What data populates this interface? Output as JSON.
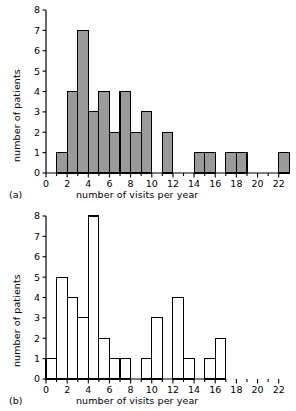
{
  "figure": {
    "name": "two-histograms-number-of-visits-per-year",
    "panels": [
      {
        "tag": "(a)",
        "xlabel": "number of visits per year",
        "ylabel": "number of patients"
      },
      {
        "tag": "(b)",
        "xlabel": "number of visits per year",
        "ylabel": "number of patients"
      }
    ]
  },
  "colors": {
    "bar_fill_a": "#9a9a9a",
    "bar_fill_b": "#ffffff",
    "bar_stroke": "#000000",
    "axis": "#000000",
    "background": "#ffffff"
  },
  "chart_data": [
    {
      "type": "bar",
      "name": "panel-a",
      "title": "(a)",
      "xlabel": "number of visits per year",
      "ylabel": "number of patients",
      "xlim": [
        0,
        22.5
      ],
      "ylim": [
        0,
        8
      ],
      "xticks": [
        0,
        2,
        4,
        6,
        8,
        10,
        12,
        14,
        16,
        18,
        20,
        22
      ],
      "xtick_labels": [
        "0",
        "2",
        "4",
        "6",
        "8",
        "10",
        "12",
        "14",
        "16",
        "18",
        "20",
        "22"
      ],
      "yticks": [
        0,
        1,
        2,
        3,
        4,
        5,
        6,
        7,
        8
      ],
      "ytick_labels": [
        "0",
        "1",
        "2",
        "3",
        "4",
        "5",
        "6",
        "7",
        "8"
      ],
      "grid": false,
      "legend": null,
      "bin_width": 1,
      "bins": [
        {
          "x0": 0,
          "x1": 1,
          "value": 0
        },
        {
          "x0": 1,
          "x1": 2,
          "value": 1
        },
        {
          "x0": 2,
          "x1": 3,
          "value": 4
        },
        {
          "x0": 3,
          "x1": 4,
          "value": 7
        },
        {
          "x0": 4,
          "x1": 5,
          "value": 3
        },
        {
          "x0": 5,
          "x1": 6,
          "value": 4
        },
        {
          "x0": 6,
          "x1": 7,
          "value": 2
        },
        {
          "x0": 7,
          "x1": 8,
          "value": 4
        },
        {
          "x0": 8,
          "x1": 9,
          "value": 2
        },
        {
          "x0": 9,
          "x1": 10,
          "value": 3
        },
        {
          "x0": 10,
          "x1": 11,
          "value": 0
        },
        {
          "x0": 11,
          "x1": 12,
          "value": 2
        },
        {
          "x0": 12,
          "x1": 13,
          "value": 0
        },
        {
          "x0": 13,
          "x1": 14,
          "value": 0
        },
        {
          "x0": 14,
          "x1": 15,
          "value": 1
        },
        {
          "x0": 15,
          "x1": 16,
          "value": 1
        },
        {
          "x0": 16,
          "x1": 17,
          "value": 0
        },
        {
          "x0": 17,
          "x1": 18,
          "value": 1
        },
        {
          "x0": 18,
          "x1": 19,
          "value": 1
        },
        {
          "x0": 19,
          "x1": 20,
          "value": 0
        },
        {
          "x0": 20,
          "x1": 21,
          "value": 0
        },
        {
          "x0": 21,
          "x1": 22,
          "value": 0
        },
        {
          "x0": 22,
          "x1": 23,
          "value": 1
        }
      ],
      "axis_end": 22.5
    },
    {
      "type": "bar",
      "name": "panel-b",
      "title": "(b)",
      "xlabel": "number of visits per year",
      "ylabel": "number of patients",
      "xlim": [
        0,
        22.5
      ],
      "ylim": [
        0,
        8
      ],
      "xticks": [
        0,
        2,
        4,
        6,
        8,
        10,
        12,
        14,
        16,
        18,
        20,
        22
      ],
      "xtick_labels": [
        "0",
        "2",
        "4",
        "6",
        "8",
        "10",
        "12",
        "14",
        "16",
        "18",
        "20",
        "22"
      ],
      "yticks": [
        0,
        1,
        2,
        3,
        4,
        5,
        6,
        7,
        8
      ],
      "ytick_labels": [
        "0",
        "1",
        "2",
        "3",
        "4",
        "5",
        "6",
        "7",
        "8"
      ],
      "grid": false,
      "legend": null,
      "bin_width": 1,
      "bins": [
        {
          "x0": 0,
          "x1": 1,
          "value": 1
        },
        {
          "x0": 1,
          "x1": 2,
          "value": 5
        },
        {
          "x0": 2,
          "x1": 3,
          "value": 4
        },
        {
          "x0": 3,
          "x1": 4,
          "value": 3
        },
        {
          "x0": 4,
          "x1": 5,
          "value": 8
        },
        {
          "x0": 5,
          "x1": 6,
          "value": 2
        },
        {
          "x0": 6,
          "x1": 7,
          "value": 1
        },
        {
          "x0": 7,
          "x1": 8,
          "value": 1
        },
        {
          "x0": 8,
          "x1": 9,
          "value": 0
        },
        {
          "x0": 9,
          "x1": 10,
          "value": 1
        },
        {
          "x0": 10,
          "x1": 11,
          "value": 3
        },
        {
          "x0": 11,
          "x1": 12,
          "value": 0
        },
        {
          "x0": 12,
          "x1": 13,
          "value": 4
        },
        {
          "x0": 13,
          "x1": 14,
          "value": 1
        },
        {
          "x0": 14,
          "x1": 15,
          "value": 0
        },
        {
          "x0": 15,
          "x1": 16,
          "value": 1
        },
        {
          "x0": 16,
          "x1": 17,
          "value": 2
        },
        {
          "x0": 17,
          "x1": 18,
          "value": 0
        },
        {
          "x0": 18,
          "x1": 19,
          "value": 0
        },
        {
          "x0": 19,
          "x1": 20,
          "value": 0
        },
        {
          "x0": 20,
          "x1": 21,
          "value": 0
        },
        {
          "x0": 21,
          "x1": 22,
          "value": 0
        },
        {
          "x0": 22,
          "x1": 23,
          "value": 0
        }
      ],
      "axis_end": 17
    }
  ]
}
